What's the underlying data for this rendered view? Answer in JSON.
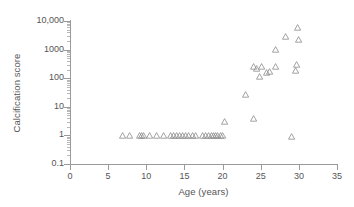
{
  "chart_data": {
    "type": "scatter",
    "title": "",
    "xlabel": "Age (years)",
    "ylabel": "Calcification score",
    "xlim": [
      0,
      35
    ],
    "ylim": [
      0.1,
      10000
    ],
    "yscale": "log",
    "xscale": "linear",
    "grid": false,
    "legend": null,
    "marker": "open-triangle",
    "marker_color": "#8c8c8c",
    "xticks": [
      0,
      5,
      10,
      15,
      20,
      25,
      30,
      35
    ],
    "xtick_labels": [
      "0",
      "5",
      "10",
      "15",
      "20",
      "25",
      "30",
      "35"
    ],
    "yticks": [
      0.1,
      1,
      10,
      100,
      1000,
      10000
    ],
    "ytick_labels": [
      "0.1",
      "1",
      "10",
      "100",
      "1000",
      "10,000"
    ],
    "points": [
      {
        "x": 6.9,
        "y": 1
      },
      {
        "x": 7.8,
        "y": 1
      },
      {
        "x": 9.1,
        "y": 1
      },
      {
        "x": 9.4,
        "y": 1
      },
      {
        "x": 9.7,
        "y": 1
      },
      {
        "x": 10.4,
        "y": 1
      },
      {
        "x": 11.3,
        "y": 1
      },
      {
        "x": 12.3,
        "y": 1
      },
      {
        "x": 13.2,
        "y": 1
      },
      {
        "x": 13.6,
        "y": 1
      },
      {
        "x": 14.0,
        "y": 1
      },
      {
        "x": 14.4,
        "y": 1
      },
      {
        "x": 14.8,
        "y": 1
      },
      {
        "x": 15.2,
        "y": 1
      },
      {
        "x": 15.6,
        "y": 1
      },
      {
        "x": 16.0,
        "y": 1
      },
      {
        "x": 16.4,
        "y": 1
      },
      {
        "x": 17.4,
        "y": 1
      },
      {
        "x": 17.8,
        "y": 1
      },
      {
        "x": 18.2,
        "y": 1
      },
      {
        "x": 18.5,
        "y": 1
      },
      {
        "x": 18.8,
        "y": 1
      },
      {
        "x": 19.1,
        "y": 1
      },
      {
        "x": 19.4,
        "y": 1
      },
      {
        "x": 19.7,
        "y": 1
      },
      {
        "x": 20.0,
        "y": 1
      },
      {
        "x": 20.2,
        "y": 3.0
      },
      {
        "x": 23.0,
        "y": 27
      },
      {
        "x": 24.1,
        "y": 4.0
      },
      {
        "x": 24.0,
        "y": 260
      },
      {
        "x": 24.4,
        "y": 230
      },
      {
        "x": 24.9,
        "y": 120
      },
      {
        "x": 25.1,
        "y": 260
      },
      {
        "x": 25.8,
        "y": 160
      },
      {
        "x": 26.1,
        "y": 180
      },
      {
        "x": 26.9,
        "y": 260
      },
      {
        "x": 27.0,
        "y": 1000
      },
      {
        "x": 28.2,
        "y": 3000
      },
      {
        "x": 29.0,
        "y": 0.95
      },
      {
        "x": 29.6,
        "y": 190
      },
      {
        "x": 29.7,
        "y": 300
      },
      {
        "x": 29.8,
        "y": 6000
      },
      {
        "x": 30.0,
        "y": 2200
      }
    ]
  }
}
